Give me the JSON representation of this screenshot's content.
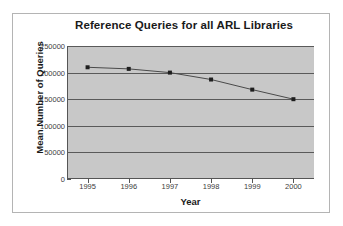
{
  "chart_data": {
    "type": "line",
    "title": "Reference Queries for all ARL Libraries",
    "xlabel": "Year",
    "ylabel": "Mean Number of Queries",
    "categories": [
      "1995",
      "1996",
      "1997",
      "1998",
      "1999",
      "2000"
    ],
    "x": [
      1995,
      1996,
      1997,
      1998,
      1999,
      2000
    ],
    "values": [
      210000,
      207000,
      200000,
      187000,
      168000,
      150000
    ],
    "series": [
      {
        "name": "Mean Number of Queries",
        "values": [
          210000,
          207000,
          200000,
          187000,
          168000,
          150000
        ]
      }
    ],
    "ylim": [
      0,
      250000
    ],
    "yticks": [
      0,
      50000,
      100000,
      150000,
      200000,
      250000
    ],
    "ytick_labels": [
      "0",
      "50000",
      "100000",
      "150000",
      "200000",
      "250000"
    ],
    "xtick_labels": [
      "1995",
      "1996",
      "1997",
      "1998",
      "1999",
      "2000"
    ],
    "xlim": [
      1994.5,
      2000.5
    ],
    "grid": "horizontal",
    "legend": "none",
    "marker": "square",
    "colors": {
      "plot_background": "#c8c8c8",
      "figure_background": "#ffffff",
      "gridline": "#5a5a5a",
      "line": "#4a4a4a",
      "marker": "#1e1e1e",
      "axis": "#555555",
      "text": "#1a1a1a",
      "frame_border": "#b4b4b4"
    }
  }
}
